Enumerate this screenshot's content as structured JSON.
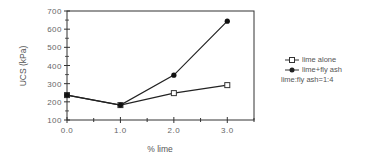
{
  "chart_data": {
    "type": "line",
    "title": "",
    "xlabel": "% lime",
    "ylabel": "UCS (kPa)",
    "xlim": [
      0.0,
      3.5
    ],
    "ylim": [
      100,
      700
    ],
    "x_ticks": [
      "0.0",
      "1.0",
      "2.0",
      "3.0"
    ],
    "y_ticks": [
      "100",
      "200",
      "300",
      "400",
      "500",
      "600",
      "700"
    ],
    "grid": false,
    "legend_position": "right",
    "x": [
      0.0,
      1.0,
      2.0,
      3.0
    ],
    "series": [
      {
        "name": "lime alone",
        "marker": "open-square",
        "values": [
          237,
          182,
          248,
          292
        ]
      },
      {
        "name": "lime+fly  ash",
        "marker": "filled-circle",
        "values": [
          237,
          182,
          347,
          644
        ]
      }
    ],
    "annotations": [
      "lime:fly  ash=1:4"
    ]
  },
  "legend": {
    "items": [
      {
        "label": "lime alone",
        "marker": "open-square-icon"
      },
      {
        "label": "lime+fly  ash",
        "marker": "filled-circle-icon"
      }
    ],
    "note": "lime:fly  ash=1:4"
  },
  "colors": {
    "line": "#222222",
    "axis": "#333333",
    "text": "#555555"
  }
}
